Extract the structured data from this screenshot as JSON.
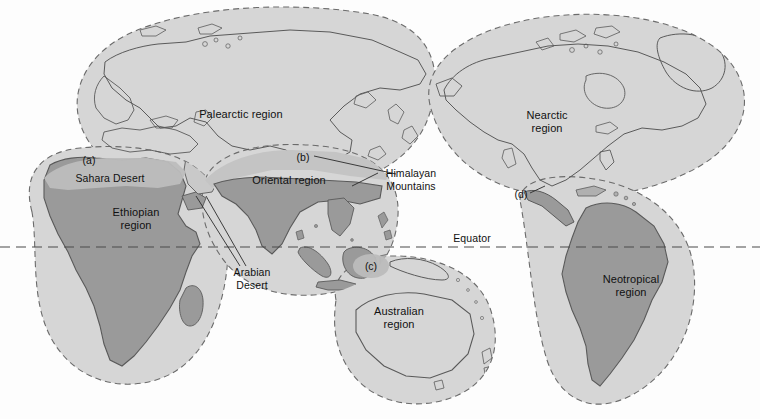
{
  "figure": {
    "type": "biogeographic-regions-map",
    "background_color": "#fdfdfd",
    "equator": {
      "label": "Equator",
      "label_x": 472,
      "label_y": 238,
      "line_y": 247,
      "style": "dashed"
    },
    "colors": {
      "region_fill": "#d6d6d6",
      "land_fill": "#b0b0b0",
      "land_fill_dark": "#9a9a9a",
      "outline": "#5a5a5a",
      "dashed_boundary": "#6b6b6b",
      "text": "#111111",
      "oriental_band": "#c4c4c4"
    },
    "regions": [
      {
        "id": "palearctic",
        "label": "Palearctic region",
        "label_x": 241,
        "label_y": 114,
        "lines": 1
      },
      {
        "id": "ethiopian",
        "label": "Ethiopian\nregion",
        "label_x": 136,
        "label_y": 218,
        "lines": 2
      },
      {
        "id": "oriental",
        "label": "Oriental region",
        "label_x": 289,
        "label_y": 180,
        "lines": 1
      },
      {
        "id": "australian",
        "label": "Australian\nregion",
        "label_x": 399,
        "label_y": 317,
        "lines": 2
      },
      {
        "id": "nearctic",
        "label": "Nearctic\nregion",
        "label_x": 547,
        "label_y": 121,
        "lines": 2
      },
      {
        "id": "neotropical",
        "label": "Neotropical\nregion",
        "label_x": 631,
        "label_y": 285,
        "lines": 2
      }
    ],
    "annotations": [
      {
        "id": "sahara-desert",
        "label": "Sahara Desert",
        "label_x": 110,
        "label_y": 178,
        "lines": 1
      },
      {
        "id": "arabian-desert",
        "label": "Arabian\nDesert",
        "label_x": 252,
        "label_y": 278,
        "lines": 2
      },
      {
        "id": "himalayan-mountains",
        "label": "Himalayan\nMountains",
        "label_x": 411,
        "label_y": 179,
        "lines": 2
      }
    ],
    "markers": [
      {
        "id": "marker-a",
        "label": "(a)",
        "x": 89,
        "y": 160,
        "note": "Sahara Desert barrier"
      },
      {
        "id": "marker-b",
        "label": "(b)",
        "x": 303,
        "y": 157,
        "note": "Himalayan Mountains barrier"
      },
      {
        "id": "marker-c",
        "label": "(c)",
        "x": 371,
        "y": 266,
        "note": "Wallace's line / Indonesian transition"
      },
      {
        "id": "marker-d",
        "label": "(d)",
        "x": 521,
        "y": 194,
        "note": "Central American isthmus"
      }
    ]
  }
}
